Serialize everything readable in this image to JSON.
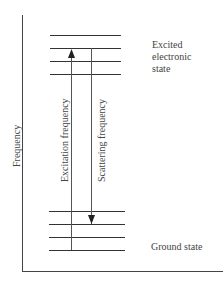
{
  "diagram": {
    "y_axis_label": "Frequency",
    "excited_state_label_lines": [
      "Excited",
      "electronic",
      "state"
    ],
    "ground_state_label": "Ground state",
    "excitation_arrow_label": "Excitation frequency",
    "scattering_arrow_label": "Scattering frequency",
    "excited_levels_y": [
      35,
      49,
      61,
      74
    ],
    "ground_levels_y": [
      211,
      224,
      237,
      250
    ],
    "colors": {
      "line": "#333333",
      "text": "#444444",
      "background": "#ffffff"
    }
  }
}
